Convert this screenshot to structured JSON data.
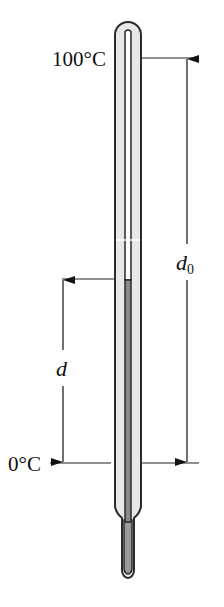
{
  "diagram": {
    "type": "thermometer-calibration",
    "labels": {
      "top_temp": "100°C",
      "bottom_temp": "0°C",
      "full_length": "d",
      "full_length_sub": "0",
      "partial_length": "d"
    },
    "colors": {
      "glass": "#e6e6e6",
      "outline": "#2a2a2a",
      "liquid": "#8a8a8a",
      "bulb": "#9a9a9a",
      "lines": "#222222"
    }
  }
}
